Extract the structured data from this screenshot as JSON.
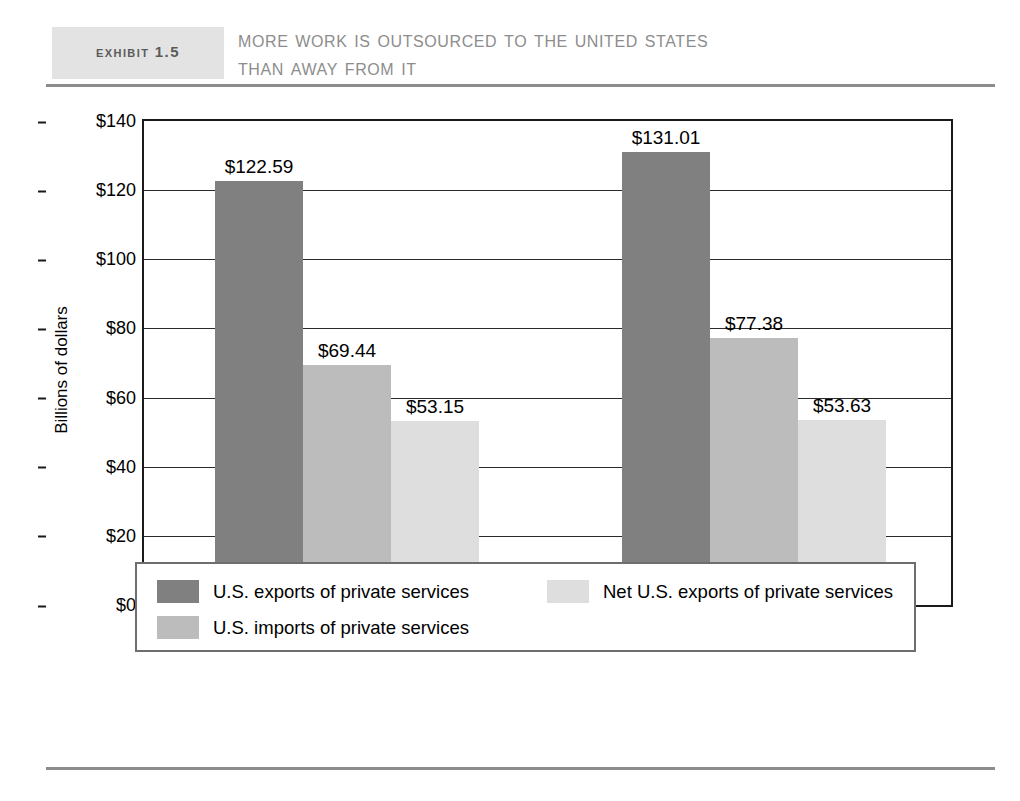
{
  "header": {
    "exhibit_tag": "Exhibit 1.5",
    "title_line_1": "More Work Is Outsourced to the United States",
    "title_line_2": "Than Away from It",
    "tag_background": "#e3e3e3",
    "tag_text_color": "#5b5b5b",
    "title_text_color": "#8d8d8d",
    "rule_color": "#8c8c8c"
  },
  "chart_data": {
    "type": "bar",
    "title": "More Work Is Outsourced to the United States Than Away from It",
    "xlabel": "",
    "ylabel": "Billions of dollars",
    "ylim": [
      0,
      140
    ],
    "ytick_labels": [
      "$0",
      "$20",
      "$40",
      "$60",
      "$80",
      "$100",
      "$120",
      "$140"
    ],
    "ytick_values": [
      0,
      20,
      40,
      60,
      80,
      100,
      120,
      140
    ],
    "grid": true,
    "legend_position": "below",
    "categories": [
      "2002",
      "2003"
    ],
    "series": [
      {
        "name": "U.S. exports of private services",
        "color": "#808080",
        "values": [
          122.59,
          131.01
        ],
        "labels": [
          "$122.59",
          "$131.01"
        ]
      },
      {
        "name": "U.S. imports of private services",
        "color": "#bcbcbc",
        "values": [
          69.44,
          77.38
        ],
        "labels": [
          "$69.44",
          "$77.38"
        ]
      },
      {
        "name": "Net U.S. exports of private services",
        "color": "#dedede",
        "values": [
          53.15,
          53.63
        ],
        "labels": [
          "$53.15",
          "$53.63"
        ]
      }
    ]
  },
  "legend": {
    "entries": [
      {
        "label": "U.S. exports of private services",
        "color": "#808080"
      },
      {
        "label": "Net U.S. exports of private services",
        "color": "#dedede"
      },
      {
        "label": "U.S. imports of private services",
        "color": "#bcbcbc"
      }
    ],
    "border_color": "#6e6e6e"
  }
}
